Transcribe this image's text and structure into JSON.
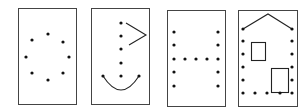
{
  "figure": {
    "width": 307,
    "height": 111,
    "stroke_color": "#444444",
    "dot_color": "#111111",
    "cards": [
      {
        "id": "circle",
        "rect": [
          18,
          8,
          58,
          96
        ],
        "dots": [
          [
            48,
            34
          ],
          [
            32,
            40
          ],
          [
            63,
            42
          ],
          [
            26,
            57
          ],
          [
            69,
            57
          ],
          [
            32,
            73
          ],
          [
            63,
            73
          ],
          [
            48,
            80
          ]
        ],
        "lines": []
      },
      {
        "id": "stick-figure",
        "rect": [
          91,
          8,
          58,
          96
        ],
        "dots": [
          [
            121,
            23
          ],
          [
            121,
            36
          ],
          [
            121,
            49
          ],
          [
            121,
            63
          ],
          [
            121,
            76
          ],
          [
            103,
            76
          ],
          [
            139,
            76
          ]
        ],
        "lines": [
          [
            [
              126,
              23
            ],
            [
              146,
              35
            ],
            [
              129,
              45
            ]
          ]
        ],
        "arc": [
          103,
          76,
          121,
          90,
          139,
          76
        ]
      },
      {
        "id": "letter-h",
        "rect": [
          167,
          10,
          58,
          96
        ],
        "dots": [
          [
            174,
            32
          ],
          [
            174,
            45
          ],
          [
            174,
            59
          ],
          [
            174,
            72
          ],
          [
            174,
            86
          ],
          [
            218,
            32
          ],
          [
            218,
            45
          ],
          [
            218,
            59
          ],
          [
            218,
            72
          ],
          [
            218,
            86
          ],
          [
            185,
            59
          ],
          [
            196,
            59
          ],
          [
            207,
            59
          ]
        ],
        "lines": []
      },
      {
        "id": "house",
        "rect": [
          238,
          10,
          59,
          96
        ],
        "dots": [
          [
            243,
            29
          ],
          [
            243,
            41
          ],
          [
            243,
            54
          ],
          [
            243,
            67
          ],
          [
            243,
            80
          ],
          [
            243,
            93
          ],
          [
            292,
            29
          ],
          [
            292,
            41
          ],
          [
            292,
            54
          ],
          [
            292,
            67
          ],
          [
            292,
            80
          ],
          [
            292,
            93
          ],
          [
            255,
            93
          ],
          [
            267,
            93
          ],
          [
            280,
            93
          ]
        ],
        "lines": [
          [
            [
              243,
              29
            ],
            [
              268,
              14
            ],
            [
              292,
              29
            ]
          ]
        ],
        "rects": [
          [
            251,
            42,
            14,
            18
          ],
          [
            271,
            68,
            17,
            24
          ]
        ]
      }
    ]
  }
}
